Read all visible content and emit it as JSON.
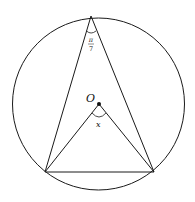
{
  "diagram": {
    "center_label": "O",
    "central_angle_label": "x",
    "inscribed_angle_label_num": "π",
    "inscribed_angle_label_den": "7",
    "colors": {
      "stroke": "#1a1a1a",
      "background": "#ffffff"
    }
  }
}
